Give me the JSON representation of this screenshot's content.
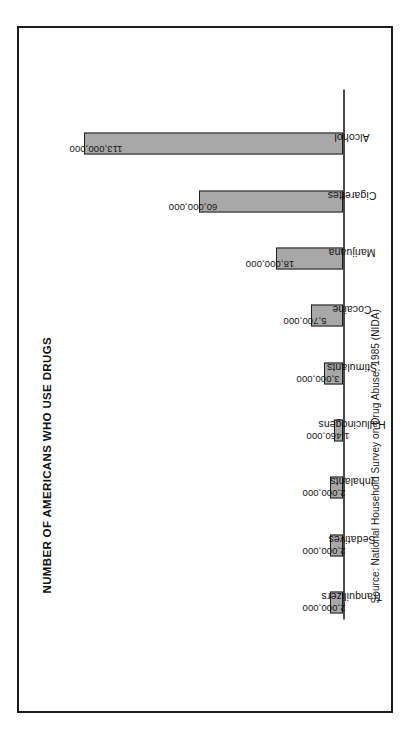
{
  "figure": {
    "title": "NUMBER OF AMERICANS WHO USE DRUGS",
    "source": "Source: National Household Survey on Drug Abuse, 1985 (NIDA)",
    "orientation": "rotated-90-ccw",
    "frame_color": "#1b1b1b",
    "bar_fill_color": "#a8a8a8",
    "bar_edge_color": "#1d1d1d",
    "background_color": "#ffffff"
  },
  "chart_data": {
    "type": "bar",
    "title": "NUMBER OF AMERICANS WHO USE DRUGS",
    "xlabel": "",
    "ylabel": "",
    "grid": false,
    "legend": false,
    "ylim": [
      0,
      113000000
    ],
    "categories": [
      "Tranquilizers",
      "Sedatives",
      "Inhalants",
      "Hallucinogens",
      "Stimulants",
      "Cocaine",
      "Marijuana",
      "Cigarettes",
      "Alcohol"
    ],
    "values": [
      2000000,
      2000000,
      2000000,
      1460000,
      3000000,
      5700000,
      18000000,
      60000000,
      113000000
    ],
    "value_labels": [
      "2,000,000",
      "2,000,000",
      "2,000,000",
      "1,460,000",
      "3,000,000",
      "5,700,000",
      "18,000,000",
      "60,000,000",
      "113,000,000"
    ]
  },
  "bars": [
    {
      "label": "Tranquilizers",
      "value_label": "2,000,000",
      "height_pct": 5.0,
      "label_inside": false
    },
    {
      "label": "Sedatives",
      "value_label": "2,000,000",
      "height_pct": 5.0,
      "label_inside": false
    },
    {
      "label": "Inhalants",
      "value_label": "2,000,000",
      "height_pct": 5.0,
      "label_inside": false
    },
    {
      "label": "Hallucinogens",
      "value_label": "1,460,000",
      "height_pct": 3.3,
      "label_inside": false
    },
    {
      "label": "Stimulants",
      "value_label": "3,000,000",
      "height_pct": 7.2,
      "label_inside": false
    },
    {
      "label": "Cocaine",
      "value_label": "5,700,000",
      "height_pct": 12.4,
      "label_inside": false
    },
    {
      "label": "Marijuana",
      "value_label": "18,000,000",
      "height_pct": 25.5,
      "label_inside": false
    },
    {
      "label": "Cigarettes",
      "value_label": "60,000,000",
      "height_pct": 55.0,
      "label_inside": false
    },
    {
      "label": "Alcohol",
      "value_label": "113,000,000",
      "height_pct": 99.0,
      "label_inside": true
    }
  ]
}
